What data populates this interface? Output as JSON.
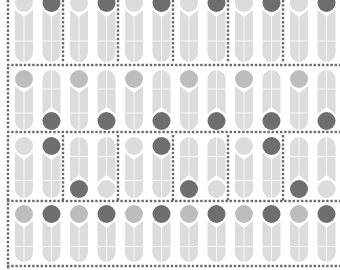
{
  "palette": {
    "background": "#ffffff",
    "light": "#dcdcdc",
    "light_stroke": "#ffffff",
    "mid": "#bdbdbd",
    "dark": "#6e6e6e",
    "dots": "#6a6a6a"
  },
  "grid": {
    "tile_width": 27.5,
    "row_bands": [
      {
        "name": "row-1",
        "y0": -6,
        "y1": 62,
        "style": "pairs-up",
        "cell_tiles": 2
      },
      {
        "name": "row-2",
        "y0": 70,
        "y1": 130,
        "style": "alternate",
        "cell_tiles": 2
      },
      {
        "name": "row-3",
        "y0": 137,
        "y1": 198,
        "style": "quad",
        "cell_tiles": 4
      },
      {
        "name": "row-4",
        "y0": 205,
        "y1": 262,
        "style": "up-alt",
        "cell_tiles": 2
      }
    ],
    "horizontal_dividers": [
      65,
      132,
      201,
      266
    ],
    "left_divider_x": 8
  }
}
